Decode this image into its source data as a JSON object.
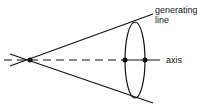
{
  "diagram": {
    "type": "cone",
    "labels": {
      "generating_line_1": "generating",
      "generating_line_2": "line",
      "axis": "axis"
    },
    "colors": {
      "stroke": "#111111",
      "background": "#ffffff"
    }
  }
}
